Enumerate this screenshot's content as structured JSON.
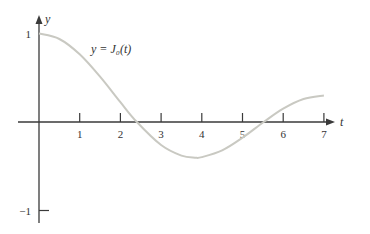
{
  "chart_data": {
    "type": "line",
    "title": "",
    "xlabel": "t",
    "ylabel": "y",
    "annotation": "y = J₀(t)",
    "xlim": [
      0,
      7.5
    ],
    "ylim": [
      -1,
      1
    ],
    "x_ticks": [
      "1",
      "2",
      "3",
      "4",
      "5",
      "6",
      "7"
    ],
    "y_ticks": [
      "1",
      "−1"
    ],
    "grid": false,
    "series": [
      {
        "name": "J0(t)",
        "function": "bessel_j0",
        "x": [
          0,
          0.5,
          1,
          1.5,
          2,
          2.405,
          3,
          3.5,
          3.832,
          4,
          4.5,
          5,
          5.52,
          6,
          6.5,
          7
        ],
        "y": [
          1,
          0.938,
          0.765,
          0.512,
          0.224,
          0,
          -0.26,
          -0.38,
          -0.403,
          -0.397,
          -0.321,
          -0.178,
          0,
          0.151,
          0.26,
          0.3
        ]
      }
    ]
  }
}
